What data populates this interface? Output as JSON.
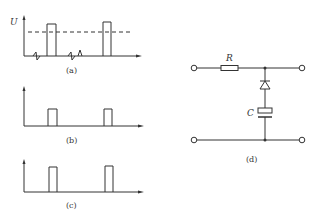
{
  "figure": {
    "panels": [
      {
        "id": "a",
        "label": "(a)",
        "axis_label": "U",
        "description": "Input pulses with noise spikes and dashed threshold line"
      },
      {
        "id": "b",
        "label": "(b)",
        "description": "Clean output pulses"
      },
      {
        "id": "c",
        "label": "(c)",
        "description": "Clean output pulses"
      },
      {
        "id": "d",
        "label": "(d)",
        "description": "RC circuit with diode",
        "components": {
          "resistor": "R",
          "capacitor": "C"
        }
      }
    ]
  }
}
